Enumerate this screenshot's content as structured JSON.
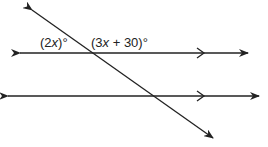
{
  "diagram": {
    "labels": {
      "left_angle": "(2x)°",
      "right_angle": "(3x + 30)°"
    },
    "left_angle_parts": {
      "open": "(2",
      "var": "x",
      "close": ")°"
    },
    "right_angle_parts": {
      "open": "(3",
      "var": "x",
      "rest": " + 30)°"
    },
    "colors": {
      "line": "#222222",
      "background": "#ffffff"
    }
  }
}
